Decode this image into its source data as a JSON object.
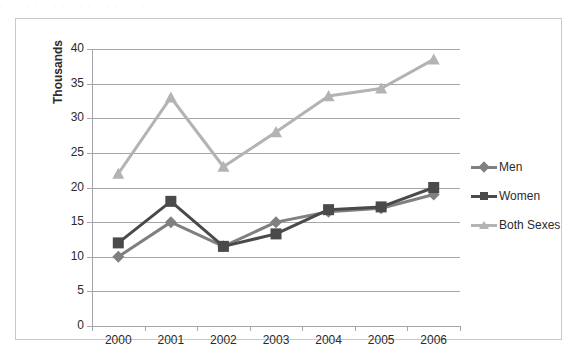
{
  "top_bleed_text": ". . . . . . . . . . . . . . . . .",
  "chart_data": {
    "type": "line",
    "title": "",
    "subtitle": "",
    "xlabel": "",
    "ylabel": "Thousands",
    "categories": [
      "2000",
      "2001",
      "2002",
      "2003",
      "2004",
      "2005",
      "2006"
    ],
    "ylim": [
      0,
      40
    ],
    "y_ticks": [
      "0",
      "5",
      "10",
      "15",
      "20",
      "25",
      "30",
      "35",
      "40"
    ],
    "grid": true,
    "legend_position": "right",
    "series": [
      {
        "name": "Men",
        "color": "#808080",
        "marker": "diamond",
        "values": [
          10,
          15,
          11.5,
          15,
          16.5,
          17,
          19
        ]
      },
      {
        "name": "Women",
        "color": "#4a4a4a",
        "marker": "square",
        "values": [
          12,
          18,
          11.5,
          13.3,
          16.8,
          17.2,
          20
        ]
      },
      {
        "name": "Both Sexes",
        "color": "#b3b3b3",
        "marker": "triangle",
        "values": [
          22,
          33,
          23,
          28,
          33.2,
          34.3,
          38.5
        ]
      }
    ]
  },
  "legend": {
    "items": [
      {
        "label": "Men"
      },
      {
        "label": "Women"
      },
      {
        "label": "Both Sexes"
      }
    ]
  },
  "colors": {
    "men": "#808080",
    "women": "#4a4a4a",
    "both_sexes": "#b3b3b3",
    "gridline": "#a6a6aa",
    "frame_border": "#c9c9cd",
    "text": "#2b2b2b",
    "background": "#ffffff"
  }
}
